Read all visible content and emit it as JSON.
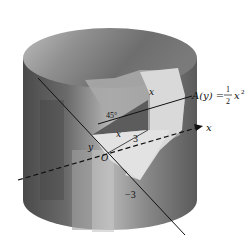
{
  "figure": {
    "labels": {
      "area_formula_lhs": "A(y) =",
      "area_formula_frac_num": "1",
      "area_formula_frac_den": "2",
      "area_formula_rhs": "x",
      "area_formula_exp": "2",
      "x_axis": "x",
      "y_axis": "y",
      "origin": "O",
      "triangle_height": "x",
      "triangle_base": "x",
      "angle": "45°",
      "radius_label": "3",
      "neg_three": "−3"
    },
    "colors": {
      "cylinder_dark": "#555555",
      "cylinder_mid": "#8a8a8a",
      "cylinder_light": "#c8c8c8",
      "wedge_light": "#e2e2e2",
      "axis": "#111111"
    }
  }
}
